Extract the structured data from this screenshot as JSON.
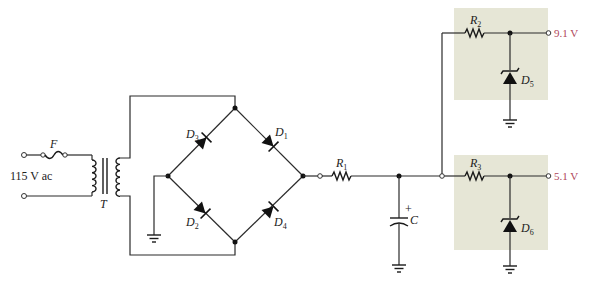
{
  "diagram": {
    "type": "power-supply-schematic",
    "source": {
      "label": "115 V ac"
    },
    "fuse": {
      "label": "F"
    },
    "transformer": {
      "label": "T"
    },
    "bridge": {
      "diodes": [
        {
          "name": "D",
          "sub": "1"
        },
        {
          "name": "D",
          "sub": "2"
        },
        {
          "name": "D",
          "sub": "3"
        },
        {
          "name": "D",
          "sub": "4"
        }
      ]
    },
    "r1": {
      "name": "R",
      "sub": "1"
    },
    "capacitor": {
      "label": "C",
      "polarity": "+"
    },
    "regulators": [
      {
        "resistor": {
          "name": "R",
          "sub": "2"
        },
        "zener": {
          "name": "D",
          "sub": "5"
        },
        "output": "9.1 V"
      },
      {
        "resistor": {
          "name": "R",
          "sub": "3"
        },
        "zener": {
          "name": "D",
          "sub": "6"
        },
        "output": "5.1 V"
      }
    ],
    "colors": {
      "wire": "#2b2b2b",
      "regulator_box": "#e6e6d6",
      "output_text": "#b0465a"
    }
  }
}
